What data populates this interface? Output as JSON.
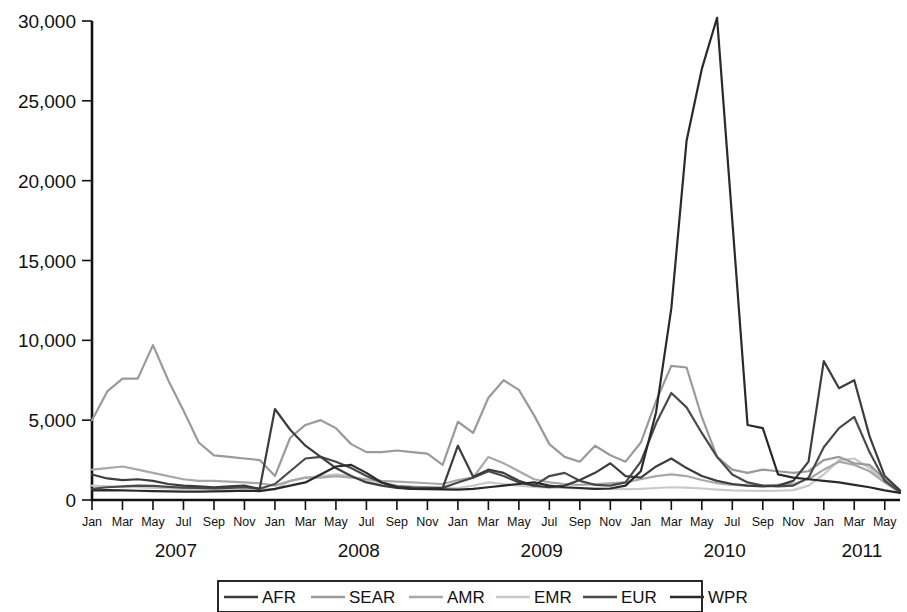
{
  "chart_data": {
    "type": "line",
    "title": "",
    "subtitle": "",
    "xlabel": "",
    "ylabel": "",
    "ylim": [
      0,
      30000
    ],
    "yticks": [
      0,
      5000,
      10000,
      15000,
      20000,
      25000,
      30000
    ],
    "ytick_labels": [
      "0",
      "5,000",
      "10,000",
      "15,000",
      "20,000",
      "25,000",
      "30,000"
    ],
    "grid": false,
    "legend_position": "bottom",
    "x_tick_labels": [
      "Jan",
      "Mar",
      "May",
      "Jul",
      "Sep",
      "Nov",
      "Jan",
      "Mar",
      "May",
      "Jul",
      "Sep",
      "Nov",
      "Jan",
      "Mar",
      "May",
      "Jul",
      "Sep",
      "Nov",
      "Jan",
      "Mar",
      "May",
      "Jul",
      "Sep",
      "Nov",
      "Jan",
      "Mar",
      "May"
    ],
    "year_labels": [
      "2007",
      "2008",
      "2009",
      "2010",
      "2011"
    ],
    "x": [
      "2007-01",
      "2007-02",
      "2007-03",
      "2007-04",
      "2007-05",
      "2007-06",
      "2007-07",
      "2007-08",
      "2007-09",
      "2007-10",
      "2007-11",
      "2007-12",
      "2008-01",
      "2008-02",
      "2008-03",
      "2008-04",
      "2008-05",
      "2008-06",
      "2008-07",
      "2008-08",
      "2008-09",
      "2008-10",
      "2008-11",
      "2008-12",
      "2009-01",
      "2009-02",
      "2009-03",
      "2009-04",
      "2009-05",
      "2009-06",
      "2009-07",
      "2009-08",
      "2009-09",
      "2009-10",
      "2009-11",
      "2009-12",
      "2010-01",
      "2010-02",
      "2010-03",
      "2010-04",
      "2010-05",
      "2010-06",
      "2010-07",
      "2010-08",
      "2010-09",
      "2010-10",
      "2010-11",
      "2010-12",
      "2011-01",
      "2011-02",
      "2011-03",
      "2011-04",
      "2011-05",
      "2011-06"
    ],
    "series": [
      {
        "name": "AFR",
        "color": "#3d3d3d",
        "values": [
          1600,
          1350,
          1250,
          1300,
          1200,
          1000,
          900,
          850,
          800,
          850,
          900,
          700,
          5700,
          4400,
          3400,
          2700,
          2000,
          1500,
          1100,
          900,
          750,
          700,
          700,
          750,
          3400,
          1450,
          1900,
          1700,
          1200,
          900,
          800,
          900,
          1250,
          1700,
          2300,
          1500,
          1400,
          2100,
          2600,
          2000,
          1500,
          1200,
          1000,
          900,
          850,
          900,
          1200,
          2400,
          8700,
          7000,
          7500,
          4000,
          1500,
          600
        ]
      },
      {
        "name": "SEAR",
        "color": "#9a9a9a",
        "values": [
          5000,
          6800,
          7600,
          7600,
          9700,
          7500,
          5600,
          3600,
          2800,
          2700,
          2600,
          2500,
          1500,
          3900,
          4700,
          5000,
          4500,
          3500,
          3000,
          3000,
          3100,
          3000,
          2900,
          2200,
          4900,
          4200,
          6400,
          7500,
          6900,
          5300,
          3500,
          2700,
          2400,
          3400,
          2800,
          2400,
          3600,
          6200,
          8400,
          8300,
          5200,
          2700,
          1900,
          1700,
          1900,
          1800,
          1700,
          1800,
          2500,
          2700,
          2300,
          2200,
          1300,
          550
        ]
      },
      {
        "name": "AMR",
        "color": "#a8a8a8",
        "values": [
          1900,
          2000,
          2100,
          1900,
          1700,
          1500,
          1300,
          1200,
          1200,
          1150,
          1100,
          1050,
          900,
          1200,
          1400,
          1400,
          1500,
          1400,
          1300,
          1200,
          1150,
          1100,
          1050,
          1000,
          1250,
          1400,
          2700,
          2300,
          1800,
          1300,
          1100,
          1000,
          950,
          1000,
          1050,
          1100,
          1300,
          1500,
          1600,
          1500,
          1250,
          1050,
          950,
          900,
          900,
          950,
          1000,
          1300,
          1900,
          2400,
          2200,
          1800,
          1100,
          500
        ]
      },
      {
        "name": "EMR",
        "color": "#c9c9c9",
        "values": [
          900,
          850,
          800,
          800,
          750,
          720,
          700,
          700,
          700,
          700,
          700,
          680,
          650,
          1200,
          1400,
          1500,
          1600,
          1500,
          1200,
          1000,
          900,
          850,
          800,
          780,
          750,
          900,
          1100,
          1000,
          900,
          820,
          780,
          750,
          720,
          700,
          700,
          680,
          700,
          750,
          800,
          780,
          720,
          650,
          600,
          580,
          570,
          580,
          620,
          900,
          1600,
          2500,
          2600,
          2000,
          1100,
          450
        ]
      },
      {
        "name": "EUR",
        "color": "#4a4a4a",
        "values": [
          700,
          800,
          850,
          900,
          880,
          820,
          780,
          750,
          720,
          760,
          800,
          700,
          1000,
          1800,
          2600,
          2700,
          2400,
          2000,
          1500,
          1100,
          850,
          800,
          780,
          760,
          1100,
          1400,
          1800,
          1500,
          1100,
          900,
          1500,
          1700,
          1200,
          950,
          900,
          1100,
          2400,
          4800,
          6700,
          5800,
          4200,
          2700,
          1600,
          1100,
          900,
          850,
          900,
          1400,
          3300,
          4500,
          5200,
          3000,
          1200,
          500
        ]
      },
      {
        "name": "WPR",
        "color": "#2a2a2a",
        "values": [
          600,
          620,
          600,
          580,
          560,
          540,
          520,
          530,
          540,
          560,
          580,
          560,
          700,
          900,
          1100,
          1600,
          2100,
          2200,
          1700,
          1100,
          800,
          700,
          680,
          660,
          650,
          700,
          800,
          900,
          1000,
          1100,
          900,
          800,
          750,
          700,
          720,
          900,
          1800,
          5500,
          12000,
          22500,
          27000,
          30200,
          17500,
          4700,
          4500,
          1600,
          1400,
          1300,
          1200,
          1100,
          950,
          800,
          600,
          450
        ]
      }
    ]
  },
  "axis": {
    "y_tick_labels": [
      "30,000",
      "25,000",
      "20,000",
      "15,000",
      "10,000",
      "5,000",
      "0"
    ]
  },
  "legend": {
    "items": [
      {
        "label": "AFR",
        "color": "#3d3d3d"
      },
      {
        "label": "SEAR",
        "color": "#9a9a9a"
      },
      {
        "label": "AMR",
        "color": "#a8a8a8"
      },
      {
        "label": "EMR",
        "color": "#c9c9c9"
      },
      {
        "label": "EUR",
        "color": "#4a4a4a"
      },
      {
        "label": "WPR",
        "color": "#2a2a2a"
      }
    ]
  }
}
